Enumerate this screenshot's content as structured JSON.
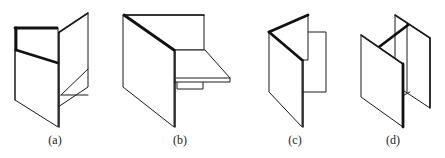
{
  "figure": {
    "panels": [
      {
        "id": "a",
        "label": "(a)",
        "x": 55
      },
      {
        "id": "b",
        "label": "(b)",
        "x": 180
      },
      {
        "id": "c",
        "label": "(c)",
        "x": 295
      },
      {
        "id": "d",
        "label": "(d)",
        "x": 393
      }
    ],
    "line_color": "#1a1a1a",
    "background": "#ffffff"
  }
}
